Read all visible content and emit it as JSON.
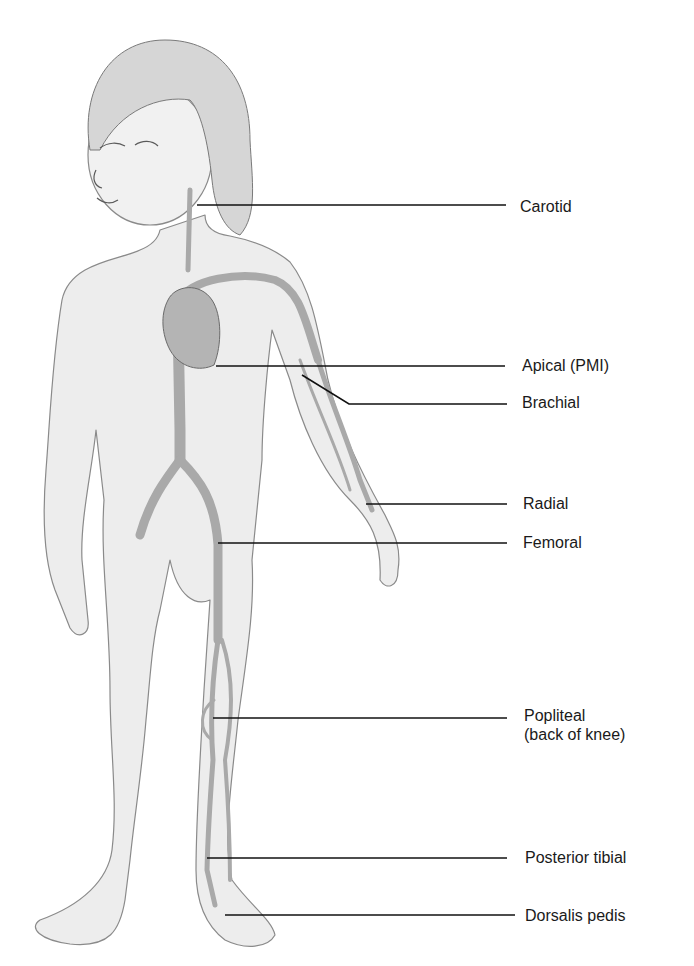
{
  "figure": {
    "colors": {
      "background": "#ffffff",
      "skin": "#ededed",
      "outline": "#8a8a8a",
      "vessel": "#a9a9a9",
      "heart": "#b4b4b4",
      "hair": "#d6d6d6",
      "leader": "#111111",
      "text": "#1a1a1a"
    }
  },
  "labels": [
    {
      "id": "carotid",
      "text": "Carotid",
      "text2": "",
      "x": 520,
      "y": 197,
      "line": [
        [
          197,
          205
        ],
        [
          506,
          205
        ]
      ]
    },
    {
      "id": "apical",
      "text": "Apical (PMI)",
      "text2": "",
      "x": 522,
      "y": 356,
      "line": [
        [
          216,
          366
        ],
        [
          505,
          366
        ]
      ]
    },
    {
      "id": "brachial",
      "text": "Brachial",
      "text2": "",
      "x": 522,
      "y": 393,
      "line": [
        [
          302,
          375
        ],
        [
          349,
          404
        ],
        [
          507,
          404
        ]
      ]
    },
    {
      "id": "radial",
      "text": "Radial",
      "text2": "",
      "x": 523,
      "y": 494,
      "line": [
        [
          366,
          504
        ],
        [
          507,
          504
        ]
      ]
    },
    {
      "id": "femoral",
      "text": "Femoral",
      "text2": "",
      "x": 523,
      "y": 533,
      "line": [
        [
          218,
          543
        ],
        [
          507,
          543
        ]
      ]
    },
    {
      "id": "popliteal",
      "text": "Popliteal",
      "text2": "(back of knee)",
      "x": 524,
      "y": 706,
      "line": [
        [
          213,
          718
        ],
        [
          507,
          718
        ]
      ]
    },
    {
      "id": "posterior-tibial",
      "text": "Posterior tibial",
      "text2": "",
      "x": 525,
      "y": 848,
      "line": [
        [
          207,
          858
        ],
        [
          507,
          858
        ]
      ]
    },
    {
      "id": "dorsalis-pedis",
      "text": "Dorsalis pedis",
      "text2": "",
      "x": 525,
      "y": 906,
      "line": [
        [
          225,
          915
        ],
        [
          515,
          915
        ]
      ]
    }
  ]
}
